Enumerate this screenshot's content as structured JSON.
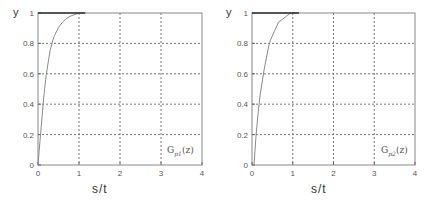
{
  "chart_data": [
    {
      "type": "line",
      "title": "",
      "xlabel": "s/t",
      "ylabel": "y",
      "xlim": [
        0,
        4
      ],
      "ylim": [
        0,
        1
      ],
      "xticks": [
        "0",
        "1",
        "2",
        "3",
        "4"
      ],
      "yticks": [
        "0",
        "0.2",
        "0.4",
        "0.6",
        "0.8",
        "1"
      ],
      "grid": true,
      "legend": {
        "text": "G",
        "subscript": "p1",
        "arg": "(z)",
        "position": "lower right"
      },
      "series": [
        {
          "name": "Gp1(z)",
          "x": [
            0,
            0.05,
            0.1,
            0.15,
            0.2,
            0.25,
            0.3,
            0.35,
            0.4,
            0.5,
            0.6,
            0.7,
            0.8,
            0.9,
            1.0,
            1.15
          ],
          "y": [
            0,
            0.16,
            0.32,
            0.47,
            0.59,
            0.68,
            0.76,
            0.81,
            0.85,
            0.905,
            0.94,
            0.965,
            0.98,
            0.99,
            1.0,
            1.0
          ]
        }
      ]
    },
    {
      "type": "line",
      "title": "",
      "xlabel": "s/t",
      "ylabel": "y",
      "xlim": [
        0,
        4
      ],
      "ylim": [
        0,
        1
      ],
      "xticks": [
        "0",
        "1",
        "2",
        "3",
        "4"
      ],
      "yticks": [
        "0",
        "0.2",
        "0.4",
        "0.6",
        "0.8",
        "1"
      ],
      "grid": true,
      "legend": {
        "text": "G",
        "subscript": "p2",
        "arg": "(z)",
        "position": "lower right"
      },
      "series": [
        {
          "name": "Gp2(z)",
          "x": [
            0,
            0.05,
            0.1,
            0.15,
            0.2,
            0.3,
            0.4,
            0.45,
            0.55,
            0.65,
            0.75,
            0.85,
            0.95,
            1.15
          ],
          "y": [
            0,
            0.0,
            0.2,
            0.34,
            0.46,
            0.63,
            0.77,
            0.82,
            0.88,
            0.94,
            0.96,
            0.98,
            1.0,
            1.0
          ]
        }
      ]
    }
  ]
}
